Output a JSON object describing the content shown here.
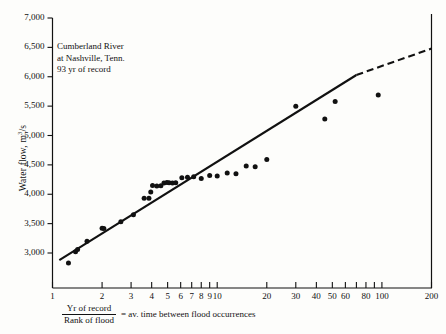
{
  "chart_data": {
    "type": "scatter",
    "title": "",
    "annotation": {
      "line1": "Cumberland River",
      "line2": "at Nashville, Tenn.",
      "line3": "93 yr of record"
    },
    "ylabel_prefix": "Water flow, m",
    "ylabel_sup": "3",
    "ylabel_suffix": "/s",
    "xlabel_numerator": "Yr of record",
    "xlabel_denominator": "Rank of flood",
    "xlabel_tail": "= av. time between flood occurrences",
    "xscale": "log",
    "yscale": "linear",
    "xlim": [
      1,
      200
    ],
    "ylim": [
      2700,
      7000
    ],
    "grid": false,
    "legend": "none",
    "yticks": [
      3000,
      3500,
      4000,
      4500,
      5000,
      5500,
      6000,
      6500,
      7000
    ],
    "ytick_labels": [
      "3,000",
      "3,500",
      "4,000",
      "4,500",
      "5,000",
      "5,500",
      "6,000",
      "6,500",
      "7,000"
    ],
    "xticks": [
      1,
      2,
      3,
      4,
      5,
      6,
      7,
      8,
      9,
      10,
      20,
      30,
      40,
      50,
      60,
      70,
      80,
      90,
      100,
      200
    ],
    "xtick_labels": [
      {
        "value": 1,
        "label": "1"
      },
      {
        "value": 2,
        "label": "2"
      },
      {
        "value": 3,
        "label": "3"
      },
      {
        "value": 4,
        "label": "4"
      },
      {
        "value": 5,
        "label": "5"
      },
      {
        "value": 6,
        "label": "6"
      },
      {
        "value": 7,
        "label": "7"
      },
      {
        "value": 8,
        "label": "8"
      },
      {
        "value": 9,
        "label": "9"
      },
      {
        "value": 10,
        "label": "10"
      },
      {
        "value": 20,
        "label": "20"
      },
      {
        "value": 30,
        "label": "30"
      },
      {
        "value": 40,
        "label": "40"
      },
      {
        "value": 50,
        "label": "50"
      },
      {
        "value": 60,
        "label": "60"
      },
      {
        "value": 80,
        "label": "80"
      },
      {
        "value": 100,
        "label": "100"
      },
      {
        "value": 200,
        "label": "200"
      }
    ],
    "series": [
      {
        "name": "Flood observations",
        "marker": "filled-circle",
        "color": "#111111",
        "points": [
          {
            "x": 1.25,
            "y": 2830
          },
          {
            "x": 1.38,
            "y": 3020
          },
          {
            "x": 1.42,
            "y": 3060
          },
          {
            "x": 1.62,
            "y": 3200
          },
          {
            "x": 2.0,
            "y": 3420
          },
          {
            "x": 2.05,
            "y": 3415
          },
          {
            "x": 2.6,
            "y": 3530
          },
          {
            "x": 3.1,
            "y": 3650
          },
          {
            "x": 3.6,
            "y": 3930
          },
          {
            "x": 3.85,
            "y": 3930
          },
          {
            "x": 3.95,
            "y": 4040
          },
          {
            "x": 4.05,
            "y": 4150
          },
          {
            "x": 4.3,
            "y": 4140
          },
          {
            "x": 4.55,
            "y": 4145
          },
          {
            "x": 4.75,
            "y": 4190
          },
          {
            "x": 4.95,
            "y": 4200
          },
          {
            "x": 5.1,
            "y": 4195
          },
          {
            "x": 5.35,
            "y": 4190
          },
          {
            "x": 5.6,
            "y": 4195
          },
          {
            "x": 6.1,
            "y": 4280
          },
          {
            "x": 6.6,
            "y": 4290
          },
          {
            "x": 7.2,
            "y": 4300
          },
          {
            "x": 8.0,
            "y": 4270
          },
          {
            "x": 9.0,
            "y": 4320
          },
          {
            "x": 10.0,
            "y": 4310
          },
          {
            "x": 11.5,
            "y": 4360
          },
          {
            "x": 13.0,
            "y": 4350
          },
          {
            "x": 15.0,
            "y": 4480
          },
          {
            "x": 17.0,
            "y": 4470
          },
          {
            "x": 20.0,
            "y": 4590
          },
          {
            "x": 30.0,
            "y": 5500
          },
          {
            "x": 45.0,
            "y": 5280
          },
          {
            "x": 52.0,
            "y": 5580
          },
          {
            "x": 95.0,
            "y": 5690
          }
        ]
      }
    ],
    "fit_line": {
      "name": "Fitted frequency line",
      "solid_from": {
        "x": 1.1,
        "y": 2880
      },
      "solid_to": {
        "x": 70,
        "y": 6030
      },
      "dashed_from": {
        "x": 70,
        "y": 6030
      },
      "dashed_to": {
        "x": 200,
        "y": 6480
      },
      "color": "#111111"
    }
  }
}
